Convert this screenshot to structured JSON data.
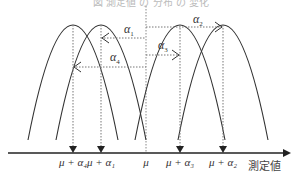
{
  "caption": "図 測定値 の 分布 の 変化",
  "axis": {
    "title": "測定値",
    "ticks": [
      {
        "id": "mu_a4",
        "label": "μ + α₄",
        "x": 73
      },
      {
        "id": "mu_a1",
        "label": "μ + α₁",
        "x": 101
      },
      {
        "id": "mu",
        "label": "μ",
        "x": 146
      },
      {
        "id": "mu_a3",
        "label": "μ + α₃",
        "x": 180
      },
      {
        "id": "mu_a2",
        "label": "μ + α₂",
        "x": 223
      }
    ]
  },
  "offsets": [
    {
      "name": "α",
      "sub": "1",
      "from_x": 146,
      "to_x": 101,
      "y": 38,
      "label_x": 124,
      "label_y": 22
    },
    {
      "name": "α",
      "sub": "2",
      "from_x": 146,
      "to_x": 223,
      "y": 27,
      "label_x": 193,
      "label_y": 12
    },
    {
      "name": "α",
      "sub": "3",
      "from_x": 146,
      "to_x": 180,
      "y": 55,
      "label_x": 158,
      "label_y": 38
    },
    {
      "name": "α",
      "sub": "4",
      "from_x": 146,
      "to_x": 73,
      "y": 67,
      "label_x": 110,
      "label_y": 50
    }
  ],
  "colors": {
    "curve": "#333333",
    "dotted": "#777777",
    "axis": "#222222"
  }
}
